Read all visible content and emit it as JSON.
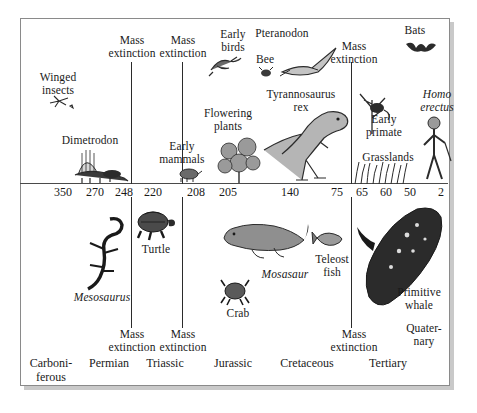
{
  "figure": {
    "background_color": "#ffffff",
    "frame_color": "#8a8a8a",
    "shadow_color": "#c9c9c9",
    "axis_color": "#4a4a4a",
    "divider_color": "#2b2b2b",
    "text_color": "#1a1a1a"
  },
  "axis": {
    "label": "Millions of years ago",
    "ticks": [
      {
        "value": "350",
        "x": 63
      },
      {
        "value": "270",
        "x": 95
      },
      {
        "value": "248",
        "x": 124
      },
      {
        "value": "220",
        "x": 153
      },
      {
        "value": "208",
        "x": 196
      },
      {
        "value": "205",
        "x": 228
      },
      {
        "value": "140",
        "x": 290
      },
      {
        "value": "75",
        "x": 337
      },
      {
        "value": "65",
        "x": 362
      },
      {
        "value": "60",
        "x": 386
      },
      {
        "value": "50",
        "x": 410
      },
      {
        "value": "2",
        "x": 441
      }
    ]
  },
  "dividers": {
    "upper": [
      {
        "name": "permian-triassic-boundary",
        "x": 131,
        "y": 62,
        "height": 122
      },
      {
        "name": "triassic-jurassic-boundary",
        "x": 182,
        "y": 62,
        "height": 122
      },
      {
        "name": "cretaceous-tertiary-boundary",
        "x": 351,
        "y": 62,
        "height": 122
      }
    ],
    "lower": [
      {
        "name": "permian-triassic-boundary-lower",
        "x": 131,
        "y": 197,
        "height": 131
      },
      {
        "name": "triassic-jurassic-boundary-lower",
        "x": 182,
        "y": 197,
        "height": 131
      },
      {
        "name": "cretaceous-tertiary-boundary-lower",
        "x": 351,
        "y": 197,
        "height": 131
      }
    ]
  },
  "upper_labels": [
    {
      "name": "winged-insects",
      "text": "Winged\ninsects",
      "x": 26,
      "y": 71,
      "w": 64,
      "italic": false
    },
    {
      "name": "mass-extinction-248",
      "text": "Mass\nextinction",
      "x": 100,
      "y": 34,
      "w": 64,
      "italic": false
    },
    {
      "name": "mass-extinction-208",
      "text": "Mass\nextinction",
      "x": 151,
      "y": 34,
      "w": 64,
      "italic": false
    },
    {
      "name": "early-birds",
      "text": "Early\nbirds",
      "x": 209,
      "y": 28,
      "w": 48,
      "italic": false
    },
    {
      "name": "pteranodon",
      "text": "Pteranodon",
      "x": 249,
      "y": 27,
      "w": 66,
      "italic": false
    },
    {
      "name": "bee",
      "text": "Bee",
      "x": 251,
      "y": 53,
      "w": 28,
      "italic": false
    },
    {
      "name": "mass-extinction-65",
      "text": "Mass\nextinction",
      "x": 322,
      "y": 40,
      "w": 64,
      "italic": false
    },
    {
      "name": "bats",
      "text": "Bats",
      "x": 399,
      "y": 24,
      "w": 32,
      "italic": false
    },
    {
      "name": "dimetrodon",
      "text": "Dimetrodon",
      "x": 55,
      "y": 134,
      "w": 70,
      "italic": false
    },
    {
      "name": "early-mammals",
      "text": "Early\nmammals",
      "x": 152,
      "y": 140,
      "w": 60,
      "italic": false
    },
    {
      "name": "flowering-plants",
      "text": "Flowering\nplants",
      "x": 196,
      "y": 107,
      "w": 64,
      "italic": false
    },
    {
      "name": "tyrannosaurus-rex",
      "text": "Tyrannosaurus\nrex",
      "x": 259,
      "y": 88,
      "w": 84,
      "italic": false
    },
    {
      "name": "early-primate",
      "text": "Early\nprimate",
      "x": 358,
      "y": 113,
      "w": 52,
      "italic": false
    },
    {
      "name": "grasslands",
      "text": "Grasslands",
      "x": 355,
      "y": 151,
      "w": 66,
      "italic": false
    },
    {
      "name": "homo-erectus",
      "text": "Homo\nerectus",
      "x": 412,
      "y": 88,
      "w": 50,
      "italic": true
    }
  ],
  "lower_labels": [
    {
      "name": "mesosaurus",
      "text": "Mesosaurus",
      "x": 66,
      "y": 291,
      "w": 72,
      "italic": true
    },
    {
      "name": "turtle",
      "text": "Turtle",
      "x": 135,
      "y": 243,
      "w": 42,
      "italic": false
    },
    {
      "name": "crab",
      "text": "Crab",
      "x": 222,
      "y": 307,
      "w": 32,
      "italic": false
    },
    {
      "name": "mosasaur",
      "text": "Mosasaur",
      "x": 255,
      "y": 268,
      "w": 60,
      "italic": true
    },
    {
      "name": "teleost-fish",
      "text": "Teleost\nfish",
      "x": 310,
      "y": 253,
      "w": 44,
      "italic": false
    },
    {
      "name": "primitive-whale",
      "text": "Primitive\nwhale",
      "x": 389,
      "y": 286,
      "w": 60,
      "italic": false
    },
    {
      "name": "mass-extinction-248-lower",
      "text": "Mass\nextinction",
      "x": 100,
      "y": 328,
      "w": 64,
      "italic": false
    },
    {
      "name": "mass-extinction-208-lower",
      "text": "Mass\nextinction",
      "x": 151,
      "y": 328,
      "w": 64,
      "italic": false
    },
    {
      "name": "mass-extinction-65-lower",
      "text": "Mass\nextinction",
      "x": 322,
      "y": 328,
      "w": 64,
      "italic": false
    },
    {
      "name": "quaternary",
      "text": "Quater-\nnary",
      "x": 399,
      "y": 322,
      "w": 50,
      "italic": false
    }
  ],
  "periods": [
    {
      "name": "period-carboniferous",
      "text": "Carboni-\nferous",
      "x": 22,
      "y": 357,
      "w": 58
    },
    {
      "name": "period-permian",
      "text": "Permian",
      "x": 83,
      "y": 357,
      "w": 52
    },
    {
      "name": "period-triassic",
      "text": "Triassic",
      "x": 140,
      "y": 357,
      "w": 50
    },
    {
      "name": "period-jurassic",
      "text": "Jurassic",
      "x": 207,
      "y": 357,
      "w": 52
    },
    {
      "name": "period-cretaceous",
      "text": "Cretaceous",
      "x": 272,
      "y": 357,
      "w": 70
    },
    {
      "name": "period-tertiary",
      "text": "Tertiary",
      "x": 363,
      "y": 357,
      "w": 50
    }
  ],
  "illustrations": [
    {
      "name": "winged-insect-illustration",
      "x": 48,
      "y": 94,
      "w": 26,
      "h": 16
    },
    {
      "name": "dimetrodon-illustration",
      "x": 72,
      "y": 145,
      "w": 58,
      "h": 38
    },
    {
      "name": "early-bird-illustration",
      "x": 207,
      "y": 52,
      "w": 36,
      "h": 24
    },
    {
      "name": "bee-illustration",
      "x": 258,
      "y": 66,
      "w": 16,
      "h": 12
    },
    {
      "name": "pteranodon-illustration",
      "x": 278,
      "y": 46,
      "w": 62,
      "h": 36
    },
    {
      "name": "bat-illustration",
      "x": 404,
      "y": 38,
      "w": 34,
      "h": 20
    },
    {
      "name": "early-mammal-illustration",
      "x": 176,
      "y": 165,
      "w": 26,
      "h": 18
    },
    {
      "name": "flowering-plant-illustration",
      "x": 215,
      "y": 133,
      "w": 48,
      "h": 50
    },
    {
      "name": "tyrannosaurus-illustration",
      "x": 262,
      "y": 98,
      "w": 88,
      "h": 85
    },
    {
      "name": "early-primate-illustration",
      "x": 352,
      "y": 88,
      "w": 44,
      "h": 46
    },
    {
      "name": "grasslands-illustration",
      "x": 352,
      "y": 160,
      "w": 60,
      "h": 24
    },
    {
      "name": "homo-erectus-illustration",
      "x": 418,
      "y": 115,
      "w": 34,
      "h": 68
    },
    {
      "name": "mesosaurus-illustration",
      "x": 80,
      "y": 215,
      "w": 50,
      "h": 75
    },
    {
      "name": "turtle-illustration",
      "x": 133,
      "y": 206,
      "w": 44,
      "h": 35
    },
    {
      "name": "mosasaur-illustration",
      "x": 222,
      "y": 212,
      "w": 88,
      "h": 50
    },
    {
      "name": "crab-illustration",
      "x": 221,
      "y": 277,
      "w": 28,
      "h": 28
    },
    {
      "name": "teleost-fish-illustration",
      "x": 314,
      "y": 229,
      "w": 30,
      "h": 18
    },
    {
      "name": "primitive-whale-illustration",
      "x": 355,
      "y": 205,
      "w": 90,
      "h": 110
    }
  ]
}
